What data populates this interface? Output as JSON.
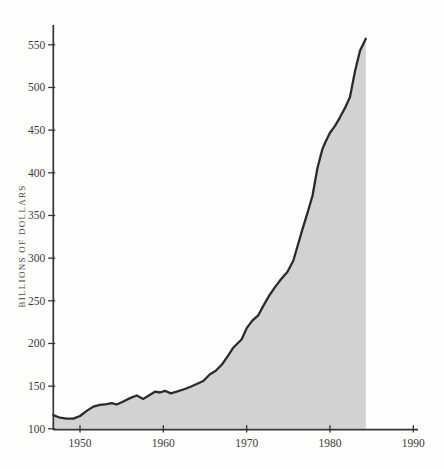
{
  "figure": {
    "ylabel": "BILLIONS OF DOLLARS"
  },
  "chart_data": {
    "type": "area",
    "title": "",
    "xlabel": "",
    "ylabel": "BILLIONS OF DOLLARS",
    "grid": false,
    "legend": false,
    "x_ticks": [
      1950,
      1960,
      1970,
      1980,
      1990
    ],
    "y_ticks": [
      100,
      150,
      200,
      250,
      300,
      350,
      400,
      450,
      500,
      550
    ],
    "x_axis_range": [
      1946.8,
      1990.6
    ],
    "y_axis_range": [
      100,
      565
    ],
    "series": [
      {
        "name": "dollars",
        "points": [
          [
            1946.8,
            116
          ],
          [
            1947.6,
            113
          ],
          [
            1948.4,
            112
          ],
          [
            1949.2,
            112
          ],
          [
            1950.0,
            115
          ],
          [
            1950.8,
            121
          ],
          [
            1951.6,
            126
          ],
          [
            1952.4,
            128
          ],
          [
            1953.2,
            129
          ],
          [
            1953.8,
            130
          ],
          [
            1954.4,
            128.5
          ],
          [
            1955.2,
            132
          ],
          [
            1956.0,
            136
          ],
          [
            1956.8,
            139
          ],
          [
            1957.6,
            135
          ],
          [
            1958.4,
            140
          ],
          [
            1959.0,
            143.5
          ],
          [
            1959.6,
            142.5
          ],
          [
            1960.2,
            144.5
          ],
          [
            1960.9,
            141.5
          ],
          [
            1961.6,
            143.5
          ],
          [
            1962.4,
            146
          ],
          [
            1963.2,
            149
          ],
          [
            1964.0,
            152.5
          ],
          [
            1964.8,
            156
          ],
          [
            1965.6,
            164
          ],
          [
            1966.3,
            168
          ],
          [
            1967.0,
            175
          ],
          [
            1967.8,
            186
          ],
          [
            1968.4,
            195
          ],
          [
            1968.8,
            199
          ],
          [
            1969.4,
            205
          ],
          [
            1970.0,
            218
          ],
          [
            1970.7,
            227
          ],
          [
            1971.4,
            233
          ],
          [
            1972.0,
            244
          ],
          [
            1972.7,
            256
          ],
          [
            1973.4,
            266
          ],
          [
            1974.1,
            275
          ],
          [
            1974.9,
            284
          ],
          [
            1975.6,
            297
          ],
          [
            1976.1,
            314
          ],
          [
            1976.7,
            334
          ],
          [
            1977.3,
            353
          ],
          [
            1977.9,
            373
          ],
          [
            1978.5,
            406
          ],
          [
            1979.1,
            428
          ],
          [
            1979.5,
            437
          ],
          [
            1980.0,
            447
          ],
          [
            1980.6,
            455
          ],
          [
            1981.2,
            465
          ],
          [
            1981.8,
            476
          ],
          [
            1982.4,
            489
          ],
          [
            1983.0,
            519
          ],
          [
            1983.6,
            543
          ],
          [
            1984.3,
            557
          ]
        ]
      }
    ],
    "start_value": 116,
    "end_value": 557,
    "colors": {
      "fill": "#d3d2d0",
      "line": "#2b2b2b",
      "axis": "#343434",
      "text": "#3a3a3a"
    }
  }
}
